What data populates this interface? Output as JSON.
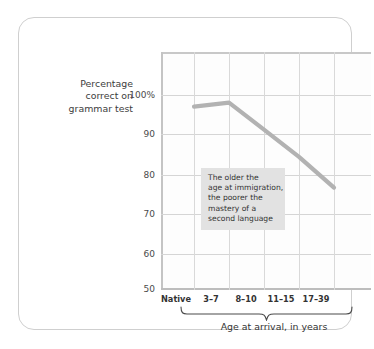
{
  "chart_data": {
    "type": "line",
    "title": "",
    "xlabel": "Age at arrival, in years",
    "ylabel": "Percentage correct on grammar test",
    "categories": [
      "Native",
      "3–7",
      "8–10",
      "11–15",
      "17–39"
    ],
    "values": [
      97,
      98,
      91,
      84,
      76
    ],
    "series": [
      {
        "name": "Percentage correct on grammar test",
        "values": [
          97,
          98,
          91,
          84,
          76
        ]
      }
    ],
    "ylim": [
      50,
      100
    ],
    "yticks": [
      100,
      90,
      80,
      70,
      60,
      50
    ],
    "ytick_labels": [
      "100%",
      "90",
      "80",
      "70",
      "60",
      "50"
    ],
    "grid": true,
    "legend": "none",
    "line_color": "#b2b2b2",
    "annotations": [
      {
        "text": "The older the age at immigration, the poorer the mastery of a second language",
        "lines": [
          "The older the",
          "age at immigration,",
          "the poorer the",
          "mastery of a",
          "second language"
        ],
        "background": "#e2e2e2"
      }
    ],
    "brace_spans": [
      "3–7",
      "8–10",
      "11–15",
      "17–39"
    ]
  },
  "axis": {
    "y_title_lines": [
      "Percentage",
      "correct on",
      "grammar test"
    ],
    "x_title": "Age at arrival, in years"
  },
  "colors": {
    "card_border": "#cfcfcf",
    "grid": "#d5d5d5",
    "line": "#b2b2b2",
    "annotation_bg": "#e2e2e2",
    "text": "#333333"
  }
}
